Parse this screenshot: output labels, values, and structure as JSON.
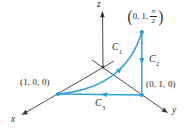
{
  "figure": {
    "colors": {
      "curve_blue": "#2a9fd6",
      "axis_black": "#3a3637",
      "text_black": "#231f20",
      "page_bg": "#ffffff"
    },
    "axes": {
      "x_label": "x",
      "y_label": "y",
      "z_label": "z"
    },
    "points": {
      "x_intercept": {
        "label": "(1, 0, 0)"
      },
      "y_intercept": {
        "label": "(0, 1, 0)"
      },
      "top": {
        "open": "(",
        "prefix": "0, 1,",
        "numerator": "π",
        "denominator": "2",
        "close": ")"
      }
    },
    "curves": {
      "c1": {
        "base": "C",
        "sub": "1"
      },
      "c2": {
        "base": "C",
        "sub": "2"
      },
      "c3": {
        "base": "C",
        "sub": "3"
      }
    }
  }
}
